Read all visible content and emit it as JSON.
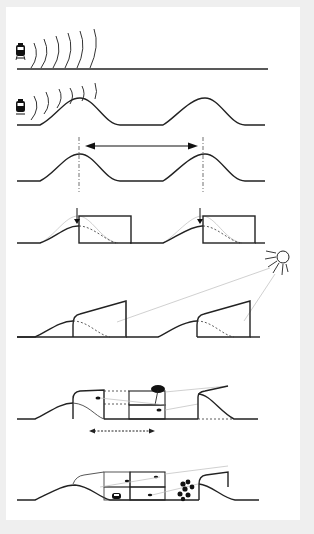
{
  "diagram": {
    "type": "sequential-section-diagram",
    "colors": {
      "background": "#efefef",
      "panel": "#ffffff",
      "line": "#222222",
      "guide": "#bbbbbb"
    },
    "panels": [
      {
        "id": "p1",
        "label": "train noise over flat ground",
        "icons": [
          "train-icon",
          "sound-waves"
        ]
      },
      {
        "id": "p2",
        "label": "mounds deflecting train noise",
        "icons": [
          "train-icon",
          "sound-waves",
          "mound"
        ]
      },
      {
        "id": "p3",
        "label": "mound spacing measured between crests",
        "icons": [
          "double-arrow",
          "crest-axis"
        ]
      },
      {
        "id": "p4",
        "label": "box buildings placed at mound crests",
        "icons": [
          "down-arrow",
          "building-box"
        ]
      },
      {
        "id": "p5",
        "label": "sloped roofs oriented to the sun",
        "icons": [
          "sun-icon",
          "sun-rays",
          "sloped-building"
        ]
      },
      {
        "id": "p6",
        "label": "stacked units with tree and sightlines",
        "icons": [
          "tree-icon",
          "eye-icon",
          "dashed-double-arrow"
        ]
      },
      {
        "id": "p7",
        "label": "program infill with car and trees",
        "icons": [
          "car-icon",
          "eye-icon",
          "trees-cluster"
        ]
      }
    ]
  }
}
